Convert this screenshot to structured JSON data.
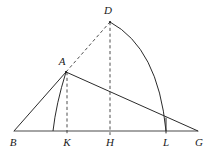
{
  "figure": {
    "background_color": "#ffffff",
    "stroke_color": "#2b2b2b",
    "dashed_color": "#3a3a3a",
    "width": 216,
    "height": 159
  },
  "points": {
    "B": {
      "label": "B",
      "x": 14,
      "y": 131,
      "label_x": 13,
      "label_y": 142
    },
    "K": {
      "label": "K",
      "x": 67,
      "y": 131,
      "label_x": 67,
      "label_y": 142
    },
    "H": {
      "label": "H",
      "x": 110,
      "y": 131,
      "label_x": 110,
      "label_y": 142
    },
    "L": {
      "label": "L",
      "x": 166,
      "y": 131,
      "label_x": 166,
      "label_y": 142
    },
    "G": {
      "label": "G",
      "x": 198,
      "y": 131,
      "label_x": 199,
      "label_y": 142
    },
    "A": {
      "label": "A",
      "x": 66,
      "y": 72,
      "label_x": 62,
      "label_y": 62
    },
    "D": {
      "label": "D",
      "x": 110,
      "y": 22,
      "label_x": 108,
      "label_y": 11
    }
  },
  "segments": {
    "baseline_BG": {
      "name": "B-G baseline",
      "from": "B",
      "to": "G",
      "style": "solid"
    },
    "line_BA": {
      "name": "B-A",
      "from": "B",
      "to": "A",
      "style": "solid"
    },
    "line_AG": {
      "name": "A-G",
      "from": "A",
      "to": "G",
      "style": "solid"
    },
    "line_AD": {
      "name": "A-D",
      "from": "A",
      "to": "D",
      "style": "dashed"
    },
    "drop_AK": {
      "name": "A-K perpendicular",
      "from": "A",
      "to": "K",
      "style": "dashed"
    },
    "drop_DH": {
      "name": "D-H perpendicular",
      "from": "D",
      "to": "H",
      "style": "dashed"
    }
  },
  "arcs": {
    "small_arc": {
      "name": "arc from A to baseline near K",
      "from_x": 66,
      "from_y": 72,
      "to_x": 53,
      "to_y": 131,
      "control_x": 56,
      "control_y": 104
    },
    "large_arc": {
      "name": "arc from D to L",
      "from_x": 110,
      "from_y": 22,
      "to_x": 166,
      "to_y": 131,
      "control_x": 158,
      "control_y": 48
    }
  },
  "labels_order": [
    "B",
    "K",
    "H",
    "L",
    "G",
    "A",
    "D"
  ]
}
